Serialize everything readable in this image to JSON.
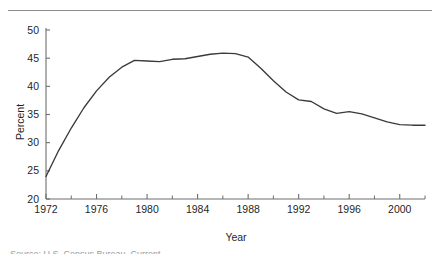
{
  "figure": {
    "top_rule": "horizontal-rule",
    "caption_partial": "Source: U.S. Census Bureau, Current"
  },
  "chart_data": {
    "type": "line",
    "title": "",
    "xlabel": "Year",
    "ylabel": "Percent",
    "xlim": [
      1972,
      2002
    ],
    "ylim": [
      20,
      50
    ],
    "grid": false,
    "legend": "none",
    "x_ticks_major": [
      1972,
      1976,
      1980,
      1984,
      1988,
      1992,
      1996,
      2000
    ],
    "x_tick_labels": [
      "1972",
      "1976",
      "1980",
      "1984",
      "1988",
      "1992",
      "1996",
      "2000"
    ],
    "x_ticks_minor": [
      1974,
      1978,
      1982,
      1986,
      1990,
      1994,
      1998,
      2002
    ],
    "y_ticks": [
      20,
      25,
      30,
      35,
      40,
      45,
      50
    ],
    "y_tick_labels": [
      "20",
      "25",
      "30",
      "35",
      "40",
      "45",
      "50"
    ],
    "series": [
      {
        "name": "Percent",
        "color": "#3a3a3a",
        "x": [
          1972,
          1973,
          1974,
          1975,
          1976,
          1977,
          1978,
          1979,
          1980,
          1981,
          1982,
          1983,
          1984,
          1985,
          1986,
          1987,
          1988,
          1989,
          1990,
          1991,
          1992,
          1993,
          1994,
          1995,
          1996,
          1997,
          1998,
          1999,
          2000,
          2001,
          2002
        ],
        "values": [
          24.0,
          28.6,
          32.6,
          36.2,
          39.2,
          41.6,
          43.4,
          44.6,
          44.5,
          44.4,
          44.8,
          44.9,
          45.3,
          45.7,
          45.9,
          45.8,
          45.2,
          43.2,
          41.0,
          39.0,
          37.6,
          37.3,
          36.0,
          35.2,
          35.5,
          35.1,
          34.4,
          33.7,
          33.2,
          33.1,
          33.1
        ]
      }
    ]
  }
}
